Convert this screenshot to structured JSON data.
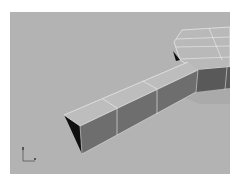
{
  "viewport": {
    "label": "",
    "view": "Perspective",
    "background_color": "#b3b3b3"
  },
  "scene": {
    "object": "extruded-box",
    "segments": 3,
    "colors": {
      "top_face": "#bcbcbc",
      "side_face": "#6f6f6f",
      "end_cap": "#111111",
      "wire": "#eeeeee",
      "hex_top": "#b8b8b8",
      "hex_side": "#585858"
    }
  },
  "axis_gizmo": {
    "x_label": "x",
    "y_label": "y"
  }
}
